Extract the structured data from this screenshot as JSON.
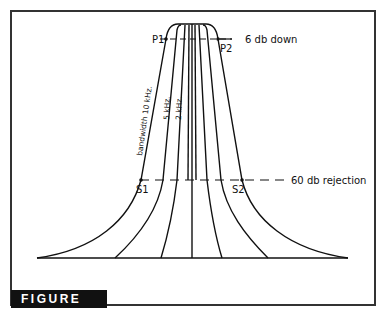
{
  "figure": {
    "label": "FIGURE 6.2"
  },
  "annotations": {
    "p1": "P1",
    "p2": "P2",
    "s1": "S1",
    "s2": "S2",
    "six_db": "6 db down",
    "sixty_db": "60 db rejection",
    "bw10": "bandwidth 10 kHz.",
    "bw5": "5 kHz.",
    "bw2": "2 kHz."
  },
  "colors": {
    "line": "#111111",
    "label_bg": "#111111",
    "label_fg": "#ffffff"
  }
}
